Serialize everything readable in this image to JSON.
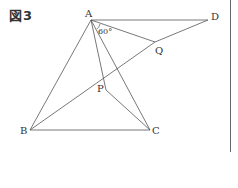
{
  "figure": {
    "title": "図3",
    "angle_label": "60°",
    "points": {
      "A": {
        "label": "A",
        "x": 91,
        "y": 20
      },
      "D": {
        "label": "D",
        "x": 208,
        "y": 20
      },
      "Q": {
        "label": "Q",
        "x": 155,
        "y": 42
      },
      "P": {
        "label": "P",
        "x": 106,
        "y": 90
      },
      "B": {
        "label": "B",
        "x": 30,
        "y": 130
      },
      "C": {
        "label": "C",
        "x": 150,
        "y": 130
      }
    },
    "segments": [
      "AD",
      "AB",
      "AP",
      "AC",
      "AQ",
      "QD",
      "BQ",
      "BC",
      "PC"
    ],
    "colors": {
      "line": "#555555",
      "text": "#333333",
      "background": "#ffffff"
    }
  }
}
